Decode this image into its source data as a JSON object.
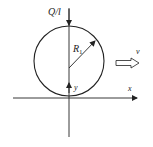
{
  "diagram": {
    "labels": {
      "load": "Q/l",
      "radius": "R",
      "radius_subscript": "1",
      "velocity": "v",
      "x_axis": "x",
      "y_axis": "y"
    },
    "colors": {
      "stroke": "#222222",
      "background": "#ffffff"
    }
  }
}
